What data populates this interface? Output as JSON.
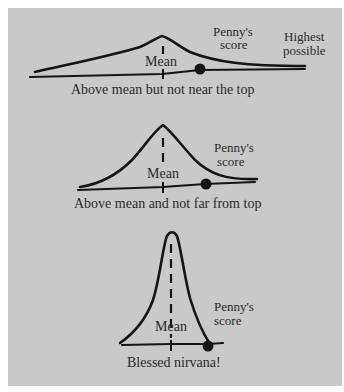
{
  "figure": {
    "background_color": "#c9c9c9",
    "ink_color": "#151515",
    "panels": [
      {
        "id": "wide",
        "mean_label": "Mean",
        "score_label_line1": "Penny's",
        "score_label_line2": "score",
        "max_label_line1": "Highest",
        "max_label_line2": "possible",
        "caption": "Above mean but not near the top"
      },
      {
        "id": "medium",
        "mean_label": "Mean",
        "score_label_line1": "Penny's",
        "score_label_line2": "score",
        "caption": "Above mean and not far from top"
      },
      {
        "id": "narrow",
        "mean_label": "Mean",
        "score_label_line1": "Penny's",
        "score_label_line2": "score",
        "caption": "Blessed nirvana!"
      }
    ]
  }
}
